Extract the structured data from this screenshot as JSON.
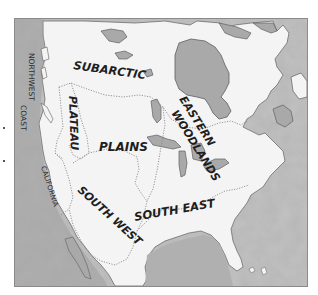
{
  "map": {
    "title": "",
    "style": "grayscale hand-drawn map of North America culture areas",
    "colors": {
      "water": "#b4b4b4",
      "water_dark": "#9e9e9e",
      "land": "#f4f4f4",
      "lake": "#a8a8a8",
      "boundary": "#8c8c8c",
      "text": "#1e1e1e",
      "frame": "#8a8a8a"
    },
    "regions": [
      {
        "id": "subarctic",
        "label": "SUBARCTIC"
      },
      {
        "id": "northwest-coast",
        "label": "NORTHWEST COAST",
        "line1": "NORTHWEST",
        "line2": "COAST"
      },
      {
        "id": "plateau",
        "label": "PLATEAU"
      },
      {
        "id": "plains",
        "label": "PLAINS"
      },
      {
        "id": "eastern-woodlands",
        "label": "EASTERN WOODLANDS",
        "line1": "EASTERN",
        "line2": "WOODLANDS"
      },
      {
        "id": "california",
        "label": "CALIFORNIA"
      },
      {
        "id": "south-west",
        "label": "SOUTH WEST"
      },
      {
        "id": "south-east",
        "label": "SOUTH EAST"
      }
    ]
  }
}
